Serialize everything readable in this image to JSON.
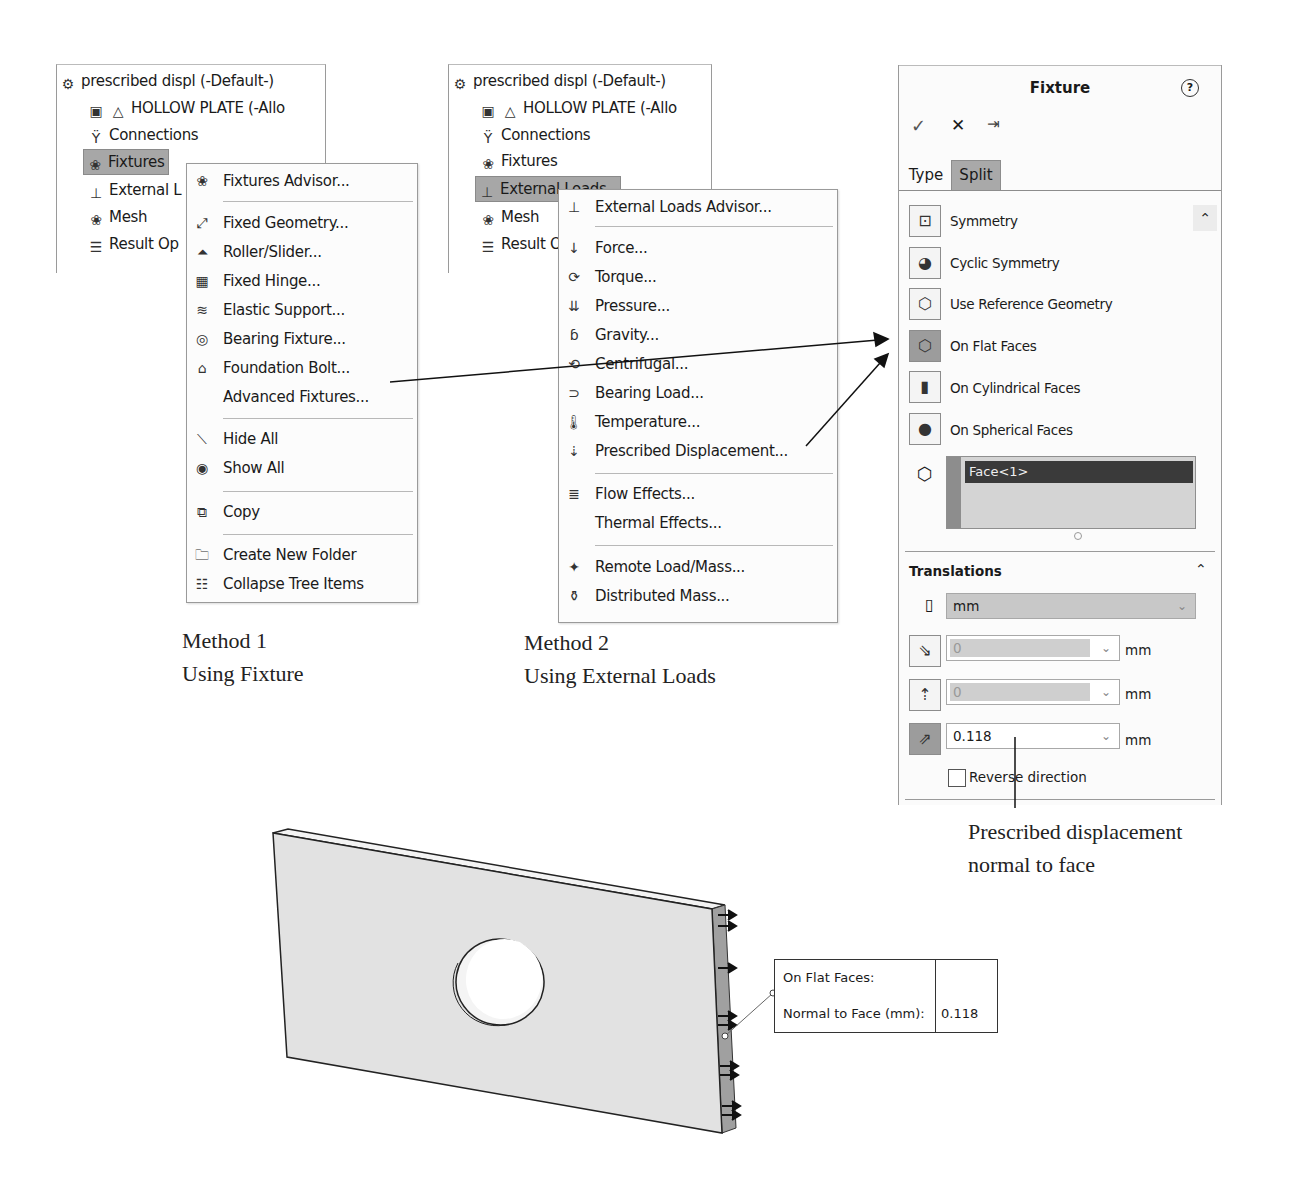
{
  "tree_common": {
    "root": "prescribed displ (-Default-)",
    "part": "HOLLOW PLATE (-Allo",
    "connections": "Connections",
    "fixtures": "Fixtures",
    "mesh": "Mesh"
  },
  "tree1": {
    "external": "External L",
    "result": "Result Op"
  },
  "tree2": {
    "external": "External Loads",
    "result": "Result O"
  },
  "fixtures_menu": {
    "items": [
      {
        "label": "Fixtures Advisor...",
        "icon": "fixtures-advisor-icon"
      },
      {
        "label": "Fixed Geometry...",
        "icon": "fixed-geometry-icon"
      },
      {
        "label": "Roller/Slider...",
        "icon": "roller-slider-icon"
      },
      {
        "label": "Fixed Hinge...",
        "icon": "fixed-hinge-icon"
      },
      {
        "label": "Elastic Support...",
        "icon": "elastic-support-icon"
      },
      {
        "label": "Bearing Fixture...",
        "icon": "bearing-fixture-icon"
      },
      {
        "label": "Foundation Bolt...",
        "icon": "foundation-bolt-icon"
      },
      {
        "label": "Advanced Fixtures...",
        "icon": ""
      },
      {
        "label": "Hide All",
        "icon": "hide-icon"
      },
      {
        "label": "Show All",
        "icon": "eye-icon"
      },
      {
        "label": "Copy",
        "icon": "copy-icon"
      },
      {
        "label": "Create New Folder",
        "icon": "folder-icon"
      },
      {
        "label": "Collapse Tree Items",
        "icon": "collapse-tree-icon"
      }
    ]
  },
  "loads_menu": {
    "items": [
      {
        "label": "External Loads Advisor...",
        "icon": "external-loads-icon"
      },
      {
        "label": "Force...",
        "icon": "force-icon"
      },
      {
        "label": "Torque...",
        "icon": "torque-icon"
      },
      {
        "label": "Pressure...",
        "icon": "pressure-icon"
      },
      {
        "label": "Gravity...",
        "icon": "gravity-icon"
      },
      {
        "label": "Centrifugal...",
        "icon": "centrifugal-icon"
      },
      {
        "label": "Bearing Load...",
        "icon": "bearing-load-icon"
      },
      {
        "label": "Temperature...",
        "icon": "temperature-icon"
      },
      {
        "label": "Prescribed Displacement...",
        "icon": "prescribed-displacement-icon"
      },
      {
        "label": "Flow Effects...",
        "icon": "flow-effects-icon"
      },
      {
        "label": "Thermal Effects...",
        "icon": ""
      },
      {
        "label": "Remote Load/Mass...",
        "icon": "remote-load-icon"
      },
      {
        "label": "Distributed Mass...",
        "icon": "distributed-mass-icon"
      }
    ]
  },
  "fixture_panel": {
    "title": "Fixture",
    "help": "?",
    "ok": "✓",
    "cancel": "✕",
    "pin": "⇥",
    "tabs": [
      "Type",
      "Split"
    ],
    "types": [
      {
        "label": "Symmetry"
      },
      {
        "label": "Cyclic Symmetry"
      },
      {
        "label": "Use Reference Geometry"
      },
      {
        "label": "On Flat Faces",
        "selected": true
      },
      {
        "label": "On Cylindrical Faces"
      },
      {
        "label": "On Spherical Faces"
      }
    ],
    "selection": "Face<1>",
    "translations": {
      "heading": "Translations",
      "unit": "mm",
      "rows": [
        {
          "value": "0",
          "unit": "mm",
          "enabled": false
        },
        {
          "value": "0",
          "unit": "mm",
          "enabled": false
        },
        {
          "value": "0.118",
          "unit": "mm",
          "enabled": true
        }
      ],
      "reverse": "Reverse direction"
    }
  },
  "captions": {
    "method1_line1": "Method 1",
    "method1_line2": "Using Fixture",
    "method2_line1": "Method 2",
    "method2_line2": "Using External Loads",
    "note_line1": "Prescribed displacement",
    "note_line2": "normal to face"
  },
  "callout": {
    "row1_label": "On Flat Faces:",
    "row1_value": "",
    "row2_label": "Normal to Face (mm):",
    "row2_value": "0.118"
  },
  "colors": {
    "selected_bg": "#a7a7a7",
    "selection_dark": "#3a3a3a",
    "selection_box": "#d4d4d4"
  }
}
